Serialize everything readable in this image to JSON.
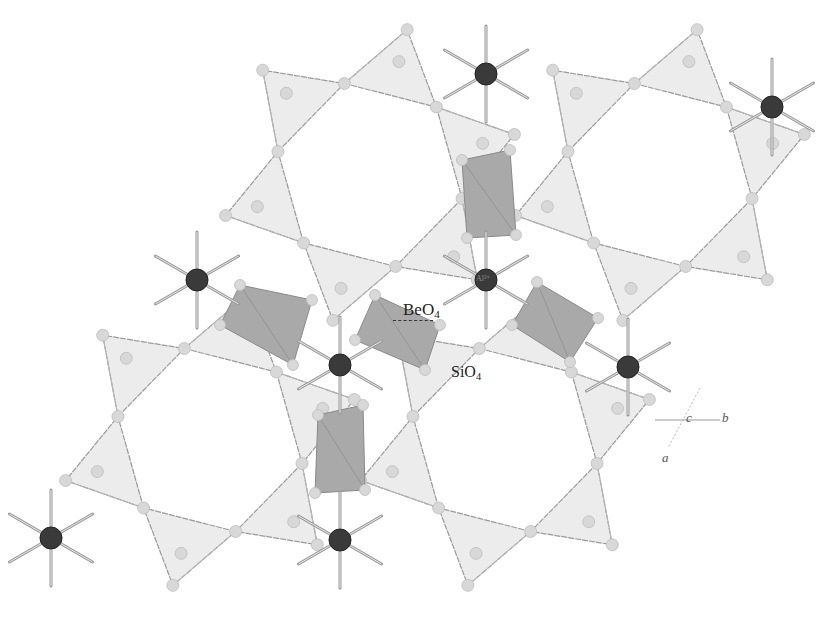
{
  "figure": {
    "colors": {
      "background": "#ffffff",
      "sio4_fill": "#ececec",
      "beo4_fill": "#a9a9a9",
      "bond": "#9a9a9a",
      "oxygen_atom": "#d8d8d8",
      "al_atom": "#3a3a3a"
    }
  },
  "labels": {
    "beo4": {
      "base": "BeO",
      "sub": "4"
    },
    "sio4": {
      "base": "SiO",
      "sub": "4"
    },
    "al": {
      "text": "Al³⁺"
    }
  },
  "axes": {
    "a": "a",
    "b": "b",
    "c": "c"
  },
  "rings": [
    {
      "cx": 370,
      "cy": 175,
      "r": 95
    },
    {
      "cx": 660,
      "cy": 175,
      "r": 95
    },
    {
      "cx": 210,
      "cy": 440,
      "r": 95
    },
    {
      "cx": 505,
      "cy": 440,
      "r": 95
    }
  ],
  "beo4_tetrahedra": [
    {
      "points": "462,160 510,150 516,235 467,238"
    },
    {
      "points": "240,285 312,300 293,365 220,325"
    },
    {
      "points": "375,295 440,325 425,370 355,340"
    },
    {
      "points": "537,282 598,318 570,362 512,325"
    },
    {
      "points": "318,415 363,405 365,490 315,493"
    }
  ],
  "al_atoms": [
    {
      "x": 486,
      "y": 74,
      "r": 11
    },
    {
      "x": 772,
      "y": 107,
      "r": 11
    },
    {
      "x": 197,
      "y": 280,
      "r": 11
    },
    {
      "x": 486,
      "y": 280,
      "r": 11
    },
    {
      "x": 340,
      "y": 365,
      "r": 11
    },
    {
      "x": 628,
      "y": 367,
      "r": 11
    },
    {
      "x": 51,
      "y": 538,
      "r": 11
    },
    {
      "x": 340,
      "y": 540,
      "r": 11
    }
  ]
}
